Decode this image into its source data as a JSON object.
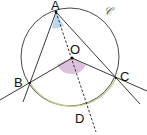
{
  "diagram": {
    "type": "geometry",
    "circle": {
      "label": "𝒞",
      "cx": 70,
      "cy": 57,
      "r": 49,
      "stroke": "#333333"
    },
    "arc_BC": {
      "stroke": "#c9c98a"
    },
    "points": {
      "A": {
        "label": "A",
        "x": 56,
        "y": 12
      },
      "B": {
        "label": "B",
        "x": 30,
        "y": 83
      },
      "C": {
        "label": "C",
        "x": 116,
        "y": 78
      },
      "O": {
        "label": "O",
        "x": 72,
        "y": 58
      },
      "D": {
        "label": "D",
        "x": 84,
        "y": 111
      }
    },
    "angles": {
      "inscribed_BAC": {
        "fill": "#bcd6ee"
      },
      "central_BOC": {
        "fill": "#dcc0dc"
      }
    },
    "lines": [
      {
        "from": "A",
        "to": "B",
        "style": "solid"
      },
      {
        "from": "A",
        "to": "C",
        "style": "solid"
      },
      {
        "from": "O",
        "to": "B",
        "style": "solid"
      },
      {
        "from": "O",
        "to": "C",
        "style": "solid"
      },
      {
        "from": "A",
        "to": "D",
        "style": "dashed"
      }
    ]
  }
}
